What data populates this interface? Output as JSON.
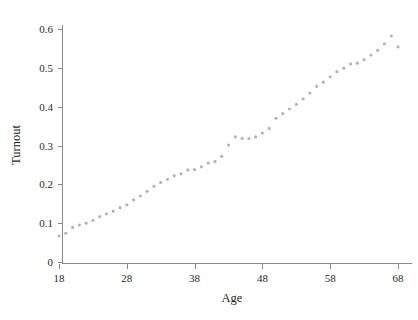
{
  "chart_data": {
    "type": "scatter",
    "title": "",
    "subtitle": "",
    "xlabel": "Age",
    "ylabel": "Turnout",
    "xlim": [
      17.0,
      69.0
    ],
    "ylim": [
      0.0,
      0.63
    ],
    "grid": false,
    "legend": null,
    "legend_position": "none",
    "marker": {
      "shape": "circle",
      "color": "#b5b5b5",
      "size_px": 3.2
    },
    "xticks": [
      18,
      28,
      38,
      48,
      58,
      68
    ],
    "xtick_labels": [
      "18",
      "28",
      "38",
      "48",
      "58",
      "68"
    ],
    "yticks": [
      0,
      0.1,
      0.2,
      0.3,
      0.4,
      0.5,
      0.6
    ],
    "ytick_labels": [
      "0",
      "0.1",
      "0.2",
      "0.3",
      "0.4",
      "0.5",
      "0.6"
    ],
    "x": [
      18,
      19,
      20,
      21,
      22,
      23,
      24,
      25,
      26,
      27,
      28,
      29,
      30,
      31,
      32,
      33,
      34,
      35,
      36,
      37,
      38,
      39,
      40,
      41,
      42,
      43,
      44,
      45,
      46,
      47,
      48,
      49,
      50,
      51,
      52,
      53,
      54,
      55,
      56,
      57,
      58,
      59,
      60,
      61,
      62,
      63,
      64,
      65,
      66,
      67,
      68
    ],
    "y": [
      0.067,
      0.074,
      0.089,
      0.095,
      0.1,
      0.107,
      0.117,
      0.124,
      0.131,
      0.14,
      0.147,
      0.16,
      0.17,
      0.182,
      0.195,
      0.205,
      0.213,
      0.222,
      0.227,
      0.237,
      0.238,
      0.245,
      0.255,
      0.259,
      0.272,
      0.301,
      0.322,
      0.318,
      0.318,
      0.322,
      0.332,
      0.344,
      0.37,
      0.382,
      0.394,
      0.406,
      0.42,
      0.435,
      0.452,
      0.463,
      0.477,
      0.49,
      0.499,
      0.51,
      0.512,
      0.521,
      0.533,
      0.545,
      0.562,
      0.582,
      0.554
    ],
    "series": [
      {
        "name": "Turnout",
        "values": [
          0.067,
          0.074,
          0.089,
          0.095,
          0.1,
          0.107,
          0.117,
          0.124,
          0.131,
          0.14,
          0.147,
          0.16,
          0.17,
          0.182,
          0.195,
          0.205,
          0.213,
          0.222,
          0.227,
          0.237,
          0.238,
          0.245,
          0.255,
          0.259,
          0.272,
          0.301,
          0.322,
          0.318,
          0.318,
          0.322,
          0.332,
          0.344,
          0.37,
          0.382,
          0.394,
          0.406,
          0.42,
          0.435,
          0.452,
          0.463,
          0.477,
          0.49,
          0.499,
          0.51,
          0.512,
          0.521,
          0.533,
          0.545,
          0.562,
          0.582,
          0.554
        ]
      }
    ],
    "annotations": []
  },
  "axes": {
    "x_title": "Age",
    "y_title": "Turnout"
  }
}
